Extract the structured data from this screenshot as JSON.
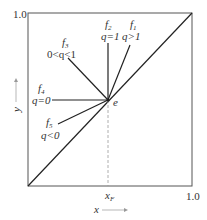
{
  "diagram": {
    "type": "McCabe-Thiele q-line diagram",
    "axes": {
      "x_label": "x",
      "y_label": "y",
      "x_max_label": "1.0",
      "y_max_label": "1.0",
      "x_marker_label": "x",
      "x_marker_sub": "F"
    },
    "point_label": "e",
    "lines": [
      {
        "name": "f",
        "sub": "1",
        "condition": "q>1"
      },
      {
        "name": "f",
        "sub": "2",
        "condition": "q=1"
      },
      {
        "name": "f",
        "sub": "3",
        "condition": "0<q<1"
      },
      {
        "name": "f",
        "sub": "4",
        "condition": "q=0"
      },
      {
        "name": "f",
        "sub": "5",
        "condition": "q<0"
      }
    ],
    "colors": {
      "line": "#222222",
      "text": "#333333",
      "dashed": "#999999"
    }
  }
}
